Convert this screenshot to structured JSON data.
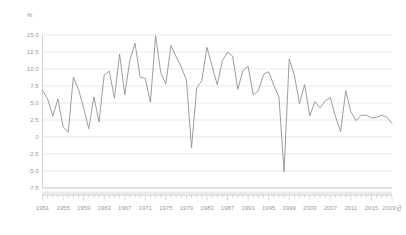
{
  "chart_data": {
    "type": "line",
    "title": "",
    "subtitle": "",
    "xlabel": "",
    "ylabel": "%",
    "unit_label": "%",
    "grid": true,
    "legend": "none",
    "xlim": [
      1951,
      2019
    ],
    "ylim": [
      -7.5,
      15.0
    ],
    "ytick_labels": [
      "15.0",
      "12.5",
      "10.0",
      "7.5",
      "5.0",
      "2.5",
      "0",
      "-2.5",
      "-5.0",
      "-7.5"
    ],
    "ytick_values": [
      15.0,
      12.5,
      10.0,
      7.5,
      5.0,
      2.5,
      0,
      -2.5,
      -5.0,
      -7.5
    ],
    "xtick_labels": [
      "1951",
      "1955",
      "1959",
      "1963",
      "1967",
      "1971",
      "1975",
      "1979",
      "1983",
      "1987",
      "1991",
      "1995",
      "1999",
      "2003",
      "2007",
      "2011",
      "2015",
      "2019년"
    ],
    "xtick_values": [
      1951,
      1955,
      1959,
      1963,
      1967,
      1971,
      1975,
      1979,
      1983,
      1987,
      1991,
      1995,
      1999,
      2003,
      2007,
      2011,
      2015,
      2019
    ],
    "series": [
      {
        "name": "growth-rate",
        "color": "#8c8c8c",
        "x": [
          1951,
          1952,
          1953,
          1954,
          1955,
          1956,
          1957,
          1958,
          1959,
          1960,
          1961,
          1962,
          1963,
          1964,
          1965,
          1966,
          1967,
          1968,
          1969,
          1970,
          1971,
          1972,
          1973,
          1974,
          1975,
          1976,
          1977,
          1978,
          1979,
          1980,
          1981,
          1982,
          1983,
          1984,
          1985,
          1986,
          1987,
          1988,
          1989,
          1990,
          1991,
          1992,
          1993,
          1994,
          1995,
          1996,
          1997,
          1998,
          1999,
          2000,
          2001,
          2002,
          2003,
          2004,
          2005,
          2006,
          2007,
          2008,
          2009,
          2010,
          2011,
          2012,
          2013,
          2014,
          2015,
          2016,
          2017,
          2018,
          2019
        ],
        "values": [
          6.9,
          5.6,
          3.1,
          5.6,
          1.5,
          0.7,
          8.8,
          7.0,
          4.3,
          1.2,
          5.9,
          2.2,
          9.1,
          9.7,
          5.7,
          12.2,
          6.2,
          11.3,
          13.8,
          8.8,
          8.6,
          5.1,
          14.9,
          9.5,
          7.8,
          13.5,
          11.8,
          10.3,
          8.4,
          -1.6,
          7.2,
          8.3,
          13.2,
          10.4,
          7.7,
          11.2,
          12.5,
          11.9,
          7.0,
          9.8,
          10.4,
          6.2,
          6.8,
          9.2,
          9.6,
          7.6,
          5.9,
          -5.1,
          11.5,
          9.1,
          4.9,
          7.7,
          3.1,
          5.2,
          4.3,
          5.3,
          5.8,
          3.0,
          0.8,
          6.8,
          3.7,
          2.4,
          3.2,
          3.2,
          2.8,
          2.9,
          3.2,
          2.9,
          2.0
        ]
      }
    ],
    "annotations": []
  }
}
